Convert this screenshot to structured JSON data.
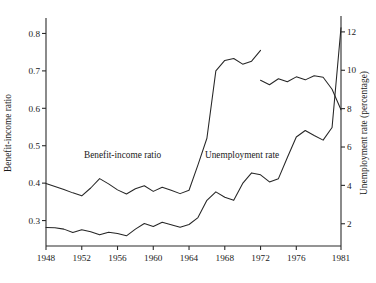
{
  "chart_data": {
    "type": "line",
    "title": "",
    "xlabel": "",
    "grid": false,
    "legend_position": "inline-annotations",
    "x_axis": {
      "label": "",
      "ticks": [
        1948,
        1952,
        1956,
        1960,
        1964,
        1968,
        1972,
        1976,
        1981
      ],
      "tick_labels": [
        "1948",
        "1952",
        "1956",
        "1960",
        "1964",
        "1968",
        "1972",
        "1976",
        "1981"
      ],
      "xlim": [
        1948,
        1981
      ]
    },
    "left_axis": {
      "label": "Benefit-income ratio",
      "ticks": [
        0.3,
        0.4,
        0.5,
        0.6,
        0.7,
        0.8
      ],
      "tick_labels": [
        "0.3",
        "0.4",
        "0.5",
        "0.6",
        "0.7",
        "0.8"
      ],
      "ylim": [
        0.232,
        0.836
      ]
    },
    "right_axis": {
      "label": "Unemployment rate (percentage)",
      "ticks": [
        2,
        4,
        6,
        8,
        10,
        12
      ],
      "tick_labels": [
        "2",
        "4",
        "6",
        "8",
        "10",
        "12"
      ],
      "ylim": [
        0.84,
        12.62
      ]
    },
    "series": [
      {
        "name": "Benefit-income ratio",
        "annotation": "Benefit-income ratio",
        "axis": "left",
        "has_break": true,
        "break_after_year": 1972,
        "x": [
          1948,
          1949,
          1950,
          1951,
          1952,
          1953,
          1954,
          1955,
          1956,
          1957,
          1958,
          1959,
          1960,
          1961,
          1962,
          1963,
          1964,
          1965,
          1966,
          1967,
          1968,
          1969,
          1970,
          1971,
          1972
        ],
        "values": [
          0.399,
          0.391,
          0.383,
          0.374,
          0.366,
          0.387,
          0.412,
          0.398,
          0.382,
          0.371,
          0.385,
          0.393,
          0.378,
          0.389,
          0.381,
          0.372,
          0.381,
          0.449,
          0.52,
          0.7,
          0.728,
          0.733,
          0.718,
          0.726,
          0.755
        ]
      },
      {
        "name": "Benefit-income ratio (post-1972 series)",
        "annotation": "",
        "axis": "left",
        "x": [
          1972,
          1973,
          1974,
          1975,
          1976,
          1977,
          1978,
          1979,
          1980,
          1981
        ],
        "values": [
          0.675,
          0.663,
          0.679,
          0.671,
          0.684,
          0.676,
          0.687,
          0.683,
          0.651,
          0.596
        ]
      },
      {
        "name": "Unemployment rate",
        "annotation": "Unemployment rate",
        "axis": "right",
        "x": [
          1948,
          1949,
          1950,
          1951,
          1952,
          1953,
          1954,
          1955,
          1956,
          1957,
          1958,
          1959,
          1960,
          1961,
          1962,
          1963,
          1964,
          1965,
          1966,
          1967,
          1968,
          1969,
          1970,
          1971,
          1972,
          1973,
          1974,
          1975,
          1976,
          1977,
          1978,
          1979,
          1980,
          1981
        ],
        "values": [
          1.8,
          1.79,
          1.72,
          1.54,
          1.69,
          1.58,
          1.42,
          1.56,
          1.49,
          1.37,
          1.72,
          2.01,
          1.86,
          2.08,
          1.95,
          1.82,
          1.96,
          2.32,
          3.22,
          3.66,
          3.38,
          3.22,
          4.1,
          4.65,
          4.55,
          4.18,
          4.35,
          5.45,
          6.52,
          6.86,
          6.6,
          6.36,
          7.02,
          12.22
        ]
      }
    ]
  },
  "annotations": {
    "benefit_income": "Benefit-income ratio",
    "unemployment": "Unemployment rate"
  }
}
